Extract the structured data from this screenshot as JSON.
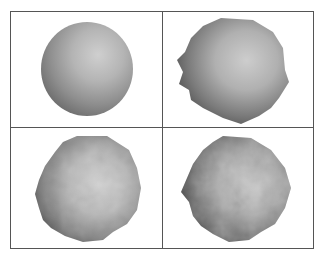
{
  "figure": {
    "panels": [
      {
        "id": "sphere-smooth",
        "description": "smooth shaded sphere"
      },
      {
        "id": "sphere-low-displacement",
        "description": "polygonal blob with smooth shading"
      },
      {
        "id": "sphere-medium-displacement",
        "description": "bumpy rock-like blob"
      },
      {
        "id": "sphere-high-displacement",
        "description": "rough textured rock-like blob"
      }
    ],
    "colors": {
      "border": "#555555",
      "shade_light": "#c8c8c8",
      "shade_mid": "#a8a8a8",
      "shade_dark": "#5a5a5a"
    }
  }
}
